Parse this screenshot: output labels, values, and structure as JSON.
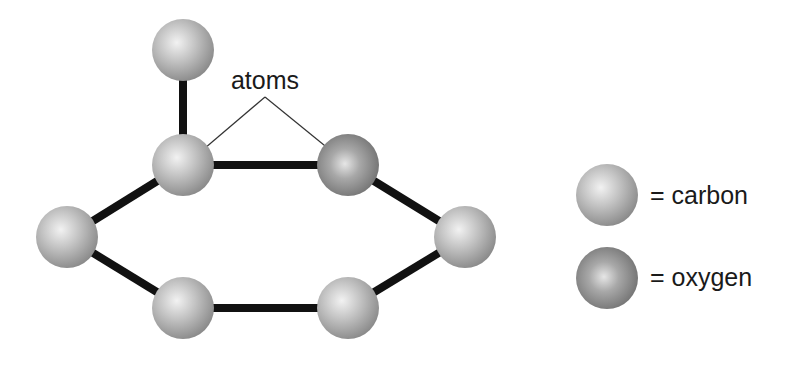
{
  "diagram": {
    "title": "",
    "annotation": {
      "text": "atoms",
      "points_to": [
        "upper-left carbon",
        "oxygen"
      ]
    },
    "atoms": [
      {
        "id": "a1",
        "element": "carbon"
      },
      {
        "id": "a2",
        "element": "carbon"
      },
      {
        "id": "a3",
        "element": "oxygen"
      },
      {
        "id": "a4",
        "element": "carbon"
      },
      {
        "id": "a5",
        "element": "carbon"
      },
      {
        "id": "a6",
        "element": "carbon"
      },
      {
        "id": "a7",
        "element": "carbon"
      }
    ],
    "bonds": [
      [
        "a1",
        "a2"
      ],
      [
        "a2",
        "a3"
      ],
      [
        "a3",
        "a5"
      ],
      [
        "a5",
        "a7"
      ],
      [
        "a7",
        "a6"
      ],
      [
        "a6",
        "a4"
      ],
      [
        "a4",
        "a2"
      ]
    ],
    "legend": [
      {
        "element": "carbon",
        "label": "= carbon",
        "color": "#b8b8b8"
      },
      {
        "element": "oxygen",
        "label": "= oxygen",
        "color": "#8f8f8f"
      }
    ],
    "colors": {
      "bond": "#111111",
      "background": "#ffffff"
    }
  }
}
